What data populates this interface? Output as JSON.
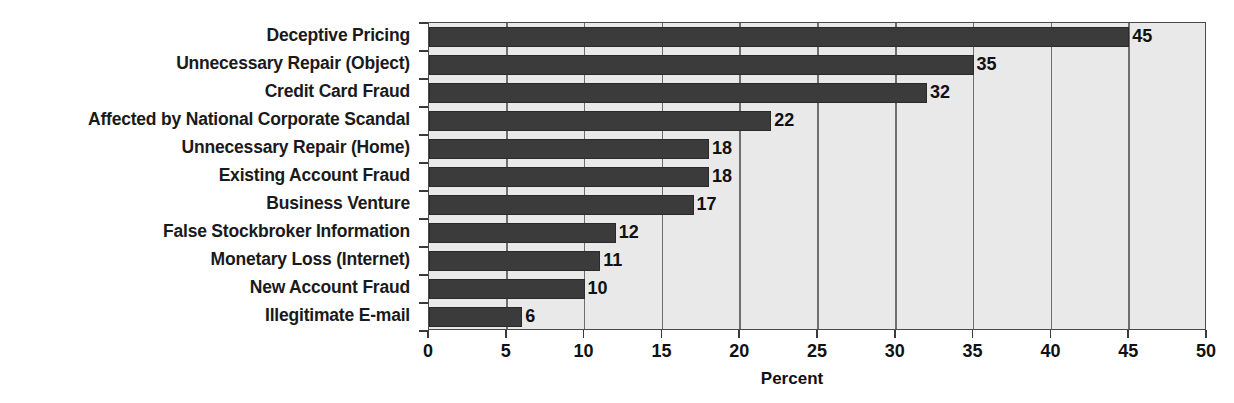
{
  "chart_data": {
    "type": "bar",
    "orientation": "horizontal",
    "title": "",
    "xlabel": "Percent",
    "ylabel": "",
    "xlim": [
      0,
      50
    ],
    "xticks": [
      0,
      5,
      10,
      15,
      20,
      25,
      30,
      35,
      40,
      45,
      50
    ],
    "xtick_labels": [
      "0",
      "5",
      "10",
      "15",
      "20",
      "25",
      "30",
      "35",
      "40",
      "45",
      "50"
    ],
    "grid": "vertical",
    "legend": "none",
    "categories": [
      "Deceptive Pricing",
      "Unnecessary Repair (Object)",
      "Credit Card Fraud",
      "Affected by National Corporate Scandal",
      "Unnecessary Repair (Home)",
      "Existing Account Fraud",
      "Business Venture",
      "False Stockbroker Information",
      "Monetary Loss (Internet)",
      "New Account Fraud",
      "Illegitimate E-mail"
    ],
    "values": [
      45,
      35,
      32,
      22,
      18,
      18,
      17,
      12,
      11,
      10,
      6
    ],
    "data_labels": [
      "45",
      "35",
      "32",
      "22",
      "18",
      "18",
      "17",
      "12",
      "11",
      "10",
      "6"
    ],
    "colors": {
      "bar": "#3b3b3b",
      "plot_background": "#e9e9e9",
      "gridline": "#6e6e6e",
      "axis": "#4a4a4a",
      "text": "#111111",
      "page_background": "#ffffff"
    }
  }
}
